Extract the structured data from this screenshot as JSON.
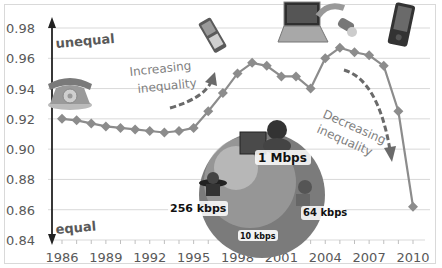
{
  "chart_data": {
    "type": "line",
    "title": "",
    "xlabel": "",
    "ylabel": "",
    "ylim": [
      0.84,
      0.98
    ],
    "xlim": [
      1986,
      2010
    ],
    "grid": true,
    "legend": null,
    "yticks": [
      "0.98",
      "0.96",
      "0.94",
      "0.92",
      "0.90",
      "0.88",
      "0.86",
      "0.84"
    ],
    "xticks": [
      "1986",
      "1989",
      "1992",
      "1995",
      "1998",
      "2001",
      "2004",
      "2007",
      "2010"
    ],
    "x": [
      1986,
      1987,
      1988,
      1989,
      1990,
      1991,
      1992,
      1993,
      1994,
      1995,
      1996,
      1997,
      1998,
      1999,
      2000,
      2001,
      2002,
      2003,
      2004,
      2005,
      2006,
      2007,
      2008,
      2009,
      2010
    ],
    "series": [
      {
        "name": "Inequality index",
        "marker": "diamond",
        "color": "#8c8c8c",
        "values": [
          0.92,
          0.919,
          0.917,
          0.915,
          0.914,
          0.913,
          0.912,
          0.911,
          0.912,
          0.914,
          0.925,
          0.937,
          0.95,
          0.957,
          0.955,
          0.948,
          0.948,
          0.94,
          0.96,
          0.967,
          0.964,
          0.962,
          0.955,
          0.925,
          0.862
        ]
      }
    ],
    "annotations": {
      "axis_top": "unequal",
      "axis_bottom": "equal",
      "increasing": [
        "Increasing",
        "inequality"
      ],
      "decreasing": [
        "Decreasing",
        "inequality"
      ],
      "speeds": [
        "1 Mbps",
        "256 kbps",
        "64 kbps",
        "10 kbps"
      ]
    }
  },
  "illustrations": [
    "telephone",
    "mobile-phone",
    "laptop",
    "usb-modem",
    "smartphone",
    "globe-with-users"
  ]
}
